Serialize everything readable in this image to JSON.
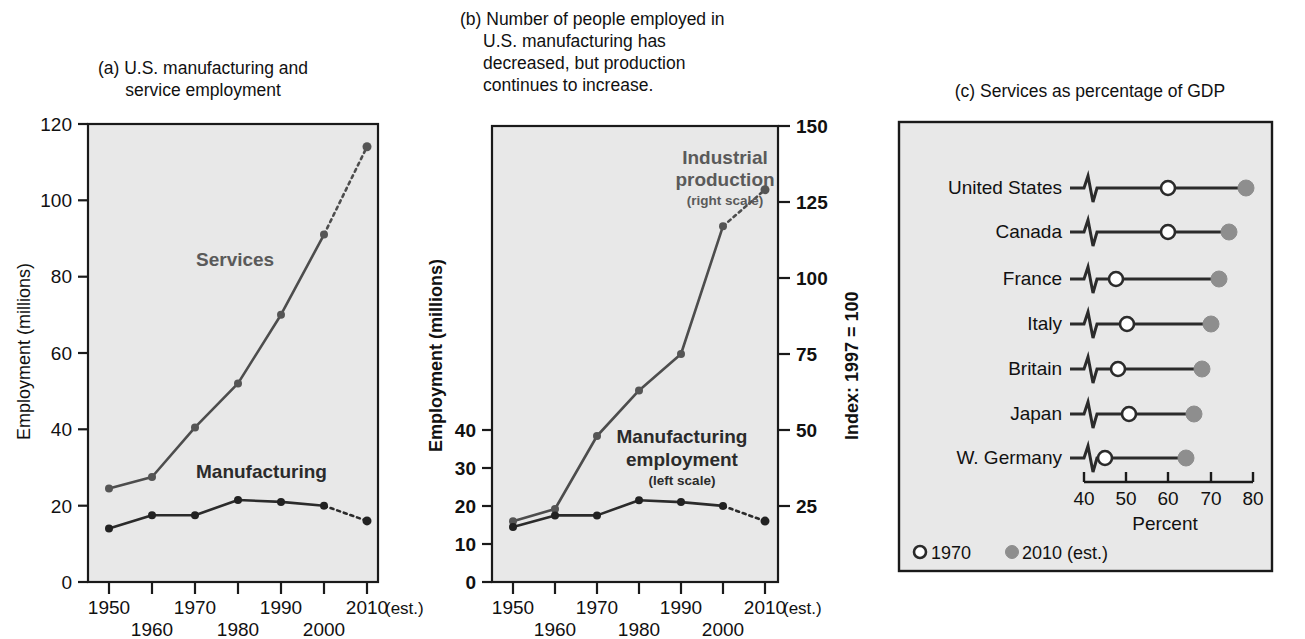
{
  "figure": {
    "panels": [
      "a",
      "b",
      "c"
    ]
  },
  "panel_a": {
    "title": "(a) U.S. manufacturing and\nservice employment",
    "y_axis_title": "Employment (millions)",
    "y_ticks": [
      "0",
      "20",
      "40",
      "60",
      "80",
      "100",
      "120"
    ],
    "x_ticks": [
      "1950",
      "1960",
      "1970",
      "1980",
      "1990",
      "2000",
      "2010"
    ],
    "x_suffix": "(est.)",
    "series_labels": {
      "services": "Services",
      "manufacturing": "Manufacturing"
    }
  },
  "panel_b": {
    "title": "(b) Number of people employed in\nU.S. manufacturing has\ndecreased, but production\ncontinues to increase.",
    "y_axis_title_left": "Employment (millions)",
    "y_axis_title_right": "Index: 1997 = 100",
    "y_ticks_left": [
      "0",
      "10",
      "20",
      "30",
      "40"
    ],
    "y_ticks_right": [
      "25",
      "50",
      "75",
      "100",
      "125",
      "150"
    ],
    "x_ticks": [
      "1950",
      "1960",
      "1970",
      "1980",
      "1990",
      "2000",
      "2010"
    ],
    "x_suffix": "(est.)",
    "series_labels": {
      "industrial": "Industrial\nproduction",
      "industrial_sub": "(right scale)",
      "manufacturing": "Manufacturing\nemployment",
      "manufacturing_sub": "(left scale)"
    }
  },
  "panel_c": {
    "title": "(c) Services as percentage of GDP",
    "x_axis_title": "Percent",
    "x_ticks": [
      "40",
      "50",
      "60",
      "70",
      "80"
    ],
    "legend": [
      {
        "marker": "open-circle",
        "label": "1970"
      },
      {
        "marker": "filled-circle",
        "label": "2010 (est.)"
      }
    ]
  },
  "colors": {
    "plot_background": "#e8e8e8",
    "axis": "#1a1a1a",
    "services_line": "#4d4d4d",
    "manufacturing_line": "#2b2b2b",
    "label_gray": "#5a5a5a",
    "filled_marker": "#8e8e8e",
    "open_marker": "#ffffff"
  },
  "chart_data": [
    {
      "type": "line",
      "panel": "a",
      "title": "(a) U.S. manufacturing and service employment",
      "xlabel": "",
      "ylabel": "Employment (millions)",
      "x": [
        1950,
        1960,
        1970,
        1980,
        1990,
        2000,
        2010
      ],
      "xlim": [
        1945,
        2012
      ],
      "ylim": [
        0,
        120
      ],
      "ytick_values": [
        0,
        20,
        40,
        60,
        80,
        100,
        120
      ],
      "grid": false,
      "legend_position": "inline-annotation",
      "series": [
        {
          "name": "Services",
          "values": [
            24.5,
            27.5,
            40.5,
            52,
            70,
            91,
            114
          ],
          "last_segment_dashed": true
        },
        {
          "name": "Manufacturing",
          "values": [
            14,
            17.5,
            17.5,
            21.5,
            21,
            20,
            16
          ],
          "last_segment_dashed": true
        }
      ]
    },
    {
      "type": "line",
      "panel": "b",
      "title": "(b) Number of people employed in U.S. manufacturing has decreased, but production continues to increase.",
      "xlabel": "",
      "ylabel": "Employment (millions)",
      "ylabel_right": "Index: 1997 = 100",
      "x": [
        1950,
        1960,
        1970,
        1980,
        1990,
        2000,
        2010
      ],
      "xlim": [
        1945,
        2012
      ],
      "ylim": [
        0,
        50
      ],
      "ylim_right": [
        0,
        150
      ],
      "ytick_values": [
        0,
        10,
        20,
        30,
        40
      ],
      "ytick_values_right": [
        25,
        50,
        75,
        100,
        125,
        150
      ],
      "grid": false,
      "legend_position": "inline-annotation",
      "series": [
        {
          "name": "Manufacturing employment (left scale)",
          "axis": "left",
          "values": [
            14.5,
            17.5,
            17.5,
            21.5,
            21,
            20,
            16
          ],
          "last_segment_dashed": true
        },
        {
          "name": "Industrial production (right scale)",
          "axis": "right",
          "values": [
            20,
            24,
            48,
            63,
            75,
            117,
            129
          ],
          "last_segment_dashed": true
        }
      ]
    },
    {
      "type": "dumbbell",
      "panel": "c",
      "title": "(c) Services as percentage of GDP",
      "xlabel": "Percent",
      "ylabel": "",
      "xlim": [
        36,
        82
      ],
      "xtick_values": [
        40,
        50,
        60,
        70,
        80
      ],
      "grid": false,
      "legend_position": "bottom-left",
      "categories": [
        "United States",
        "Canada",
        "France",
        "Italy",
        "Britain",
        "Japan",
        "W. Germany"
      ],
      "series": [
        {
          "name": "1970",
          "marker": "open-circle",
          "values": [
            60,
            60,
            47.5,
            50,
            48,
            50.5,
            45
          ]
        },
        {
          "name": "2010 (est.)",
          "marker": "filled-circle",
          "values": [
            78,
            74,
            72,
            70,
            68,
            66,
            64
          ]
        }
      ]
    }
  ]
}
